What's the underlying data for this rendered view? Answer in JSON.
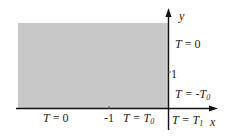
{
  "diagram": {
    "region": {
      "fill": "#c8c8c8",
      "description": "semi-infinite strip x<0, y>0"
    },
    "axes": {
      "x_label": "x",
      "y_label": "y",
      "x_tick_label": "-1",
      "y_tick_label": "1"
    },
    "boundary_conditions": {
      "left_bottom": {
        "var": "T",
        "eq": " = 0",
        "sub": ""
      },
      "middle_bottom": {
        "var": "T",
        "eq": " = T",
        "sub": "0"
      },
      "right_upper": {
        "var": "T",
        "eq": " = 0",
        "sub": ""
      },
      "right_lower": {
        "var": "T",
        "eq": " = -T",
        "sub": "0"
      },
      "origin_below": {
        "var": "T",
        "eq": " = T",
        "sub": "1"
      }
    },
    "colors": {
      "axis": "#111111",
      "text": "#222222"
    }
  }
}
